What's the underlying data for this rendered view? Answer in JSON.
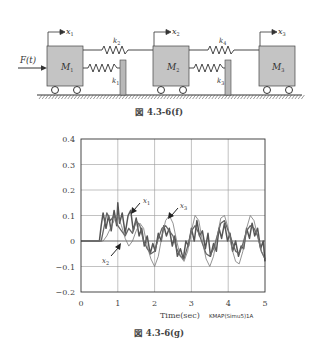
{
  "figure_f": {
    "caption": "図 4.3-6(f)",
    "force_label": "F(t)",
    "masses": [
      {
        "label": "M",
        "sub": "1",
        "disp": "x",
        "disp_sub": "1"
      },
      {
        "label": "M",
        "sub": "2",
        "disp": "x",
        "disp_sub": "2"
      },
      {
        "label": "M",
        "sub": "3",
        "disp": "x",
        "disp_sub": "3"
      }
    ],
    "springs": [
      {
        "label": "k",
        "sub": "1"
      },
      {
        "label": "k",
        "sub": "2"
      },
      {
        "label": "k",
        "sub": "3"
      },
      {
        "label": "k",
        "sub": "4"
      }
    ],
    "colors": {
      "mass_fill": "#c4c4c4",
      "line": "#333333",
      "post_fill": "#b8b8b8"
    }
  },
  "figure_g": {
    "caption": "図 4.3-6(g)",
    "credit": "KMAP(Simu5)1A",
    "annotations": [
      {
        "label": "x",
        "sub": "1"
      },
      {
        "label": "x",
        "sub": "3"
      },
      {
        "label": "x",
        "sub": "2"
      }
    ]
  },
  "chart_data": {
    "type": "line",
    "title": "",
    "xlabel": "Time(sec)",
    "ylabel": "",
    "xlim": [
      0,
      5
    ],
    "ylim": [
      -0.2,
      0.4
    ],
    "xticks": [
      "0",
      "1",
      "2",
      "3",
      "4",
      "5"
    ],
    "yticks": [
      "0.4",
      "0.3",
      "0.2",
      "0.1",
      "0",
      "-0.1",
      "-0.2"
    ],
    "grid": true,
    "legend": "inline arrows (x1, x2, x3)",
    "series": [
      {
        "name": "x1",
        "x": [
          0,
          0.5,
          0.55,
          0.6,
          0.68,
          0.75,
          0.82,
          0.9,
          0.97,
          1.0,
          1.05,
          1.12,
          1.2,
          1.28,
          1.35,
          1.42,
          1.5,
          1.58,
          1.65,
          1.72,
          1.8,
          1.88,
          1.95,
          2.02,
          2.1,
          2.18,
          2.25,
          2.32,
          2.4,
          2.48,
          2.55,
          2.62,
          2.7,
          2.78,
          2.85,
          2.92,
          3.0,
          3.08,
          3.15,
          3.22,
          3.3,
          3.38,
          3.45,
          3.52,
          3.6,
          3.68,
          3.75,
          3.82,
          3.9,
          3.98,
          4.05,
          4.12,
          4.2,
          4.28,
          4.35,
          4.42,
          4.5,
          4.58,
          4.65,
          4.72,
          4.8,
          4.88,
          4.95,
          5.0
        ],
        "y": [
          0,
          0,
          0.06,
          0.11,
          0.05,
          0.1,
          0.04,
          0.12,
          0.06,
          0.15,
          0.07,
          0.11,
          0.03,
          0.1,
          0.12,
          0.04,
          0.09,
          0.02,
          0.05,
          -0.02,
          0.02,
          -0.05,
          -0.01,
          -0.04,
          0.03,
          0.0,
          0.06,
          0.02,
          0.05,
          -0.02,
          0.02,
          -0.06,
          -0.03,
          -0.07,
          0.0,
          -0.02,
          0.05,
          0.0,
          0.08,
          0.02,
          0.04,
          -0.03,
          0.03,
          -0.06,
          -0.01,
          -0.04,
          0.05,
          0.01,
          0.07,
          0.0,
          0.03,
          -0.04,
          0.0,
          -0.06,
          -0.02,
          -0.03,
          0.05,
          0.01,
          0.07,
          0.02,
          0.05,
          -0.03,
          0.0,
          -0.08
        ]
      },
      {
        "name": "x2",
        "x": [
          0,
          0.55,
          0.62,
          0.7,
          0.8,
          0.9,
          1.0,
          1.1,
          1.2,
          1.3,
          1.4,
          1.5,
          1.6,
          1.7,
          1.8,
          1.9,
          2.0,
          2.1,
          2.2,
          2.3,
          2.4,
          2.5,
          2.6,
          2.7,
          2.8,
          2.9,
          3.0,
          3.1,
          3.2,
          3.3,
          3.4,
          3.5,
          3.6,
          3.7,
          3.8,
          3.9,
          4.0,
          4.1,
          4.2,
          4.3,
          4.4,
          4.5,
          4.6,
          4.7,
          4.8,
          4.9,
          5.0
        ],
        "y": [
          0,
          0,
          0.05,
          0.11,
          0.08,
          0.1,
          0.06,
          0.04,
          0.02,
          0.05,
          0.03,
          0.08,
          0.06,
          0.0,
          -0.03,
          -0.05,
          -0.04,
          0.01,
          0.05,
          0.06,
          0.04,
          0.02,
          -0.03,
          -0.06,
          -0.07,
          -0.02,
          0.04,
          0.06,
          0.03,
          -0.01,
          -0.05,
          -0.06,
          -0.03,
          0.02,
          0.07,
          0.08,
          0.04,
          0.0,
          -0.04,
          -0.05,
          -0.01,
          0.04,
          0.06,
          0.05,
          0.02,
          -0.04,
          -0.07
        ]
      },
      {
        "name": "x3",
        "x": [
          0,
          0.6,
          0.7,
          0.8,
          0.9,
          1.0,
          1.1,
          1.2,
          1.3,
          1.4,
          1.5,
          1.6,
          1.7,
          1.8,
          1.9,
          2.0,
          2.1,
          2.2,
          2.3,
          2.4,
          2.5,
          2.6,
          2.7,
          2.8,
          2.9,
          3.0,
          3.1,
          3.2,
          3.3,
          3.4,
          3.5,
          3.6,
          3.7,
          3.8,
          3.9,
          4.0,
          4.1,
          4.2,
          4.3,
          4.4,
          4.5,
          4.6,
          4.7,
          4.8,
          4.9,
          5.0
        ],
        "y": [
          0,
          0,
          0.02,
          0.05,
          0.08,
          0.1,
          0.06,
          0.01,
          -0.02,
          0.0,
          0.04,
          0.07,
          0.05,
          -0.02,
          -0.07,
          -0.1,
          -0.06,
          0.02,
          0.08,
          0.1,
          0.07,
          0.0,
          -0.06,
          -0.08,
          -0.04,
          0.04,
          0.1,
          0.08,
          0.0,
          -0.07,
          -0.1,
          -0.06,
          0.02,
          0.09,
          0.1,
          0.05,
          -0.03,
          -0.08,
          -0.09,
          -0.04,
          0.05,
          0.1,
          0.08,
          0.02,
          -0.04,
          -0.07
        ]
      }
    ]
  }
}
